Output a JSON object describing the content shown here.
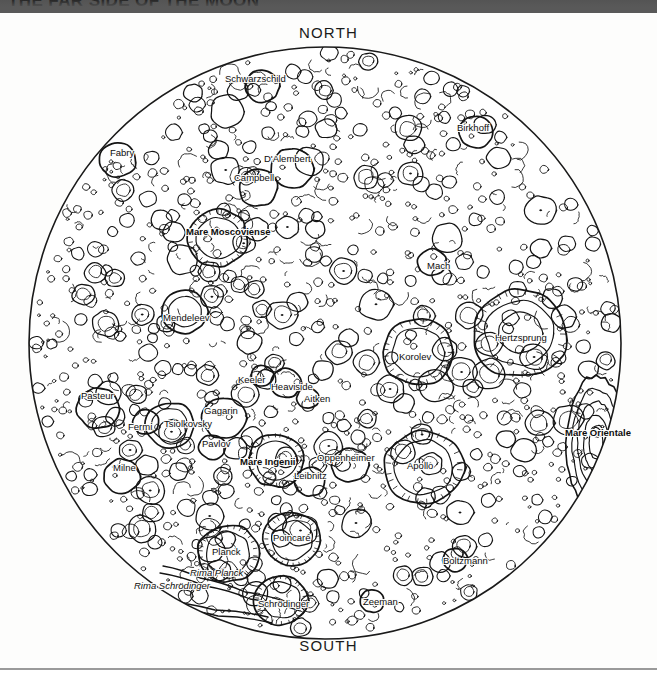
{
  "banner": {
    "title": "THE FAR SIDE OF THE MOON",
    "background_color": "#595959"
  },
  "map": {
    "cardinals": {
      "north": "NORTH",
      "south": "SOUTH"
    },
    "disc": {
      "center_x": 325,
      "center_y": 343,
      "radius": 297,
      "outline_color": "#1a1a1a",
      "fill_color": "#ffffff"
    },
    "features": [
      {
        "name": "Schwarzschild",
        "kind": "crater",
        "x": 255,
        "y": 79
      },
      {
        "name": "Birkhoff",
        "kind": "crater",
        "x": 473,
        "y": 128
      },
      {
        "name": "Fabry",
        "kind": "crater",
        "x": 122,
        "y": 153
      },
      {
        "name": "D'Alembert",
        "kind": "crater",
        "x": 287,
        "y": 159
      },
      {
        "name": "Campbell",
        "kind": "crater",
        "x": 254,
        "y": 178
      },
      {
        "name": "Mare Moscoviense",
        "kind": "mare",
        "x": 228,
        "y": 232
      },
      {
        "name": "Mach",
        "kind": "crater",
        "x": 438,
        "y": 266
      },
      {
        "name": "Mendeleev",
        "kind": "crater",
        "x": 186,
        "y": 318
      },
      {
        "name": "Hertzsprung",
        "kind": "mare_basin",
        "x": 521,
        "y": 338
      },
      {
        "name": "Korolev",
        "kind": "crater",
        "x": 415,
        "y": 357
      },
      {
        "name": "Keeler",
        "kind": "crater",
        "x": 251,
        "y": 380
      },
      {
        "name": "Heaviside",
        "kind": "crater",
        "x": 292,
        "y": 387
      },
      {
        "name": "Aitken",
        "kind": "crater",
        "x": 317,
        "y": 399
      },
      {
        "name": "Pasteur",
        "kind": "crater",
        "x": 97,
        "y": 396
      },
      {
        "name": "Gagarin",
        "kind": "crater",
        "x": 221,
        "y": 411
      },
      {
        "name": "Tsiolkovsky",
        "kind": "crater",
        "x": 188,
        "y": 424
      },
      {
        "name": "Fermi",
        "kind": "crater",
        "x": 140,
        "y": 427
      },
      {
        "name": "Pavlov",
        "kind": "crater",
        "x": 216,
        "y": 444
      },
      {
        "name": "Mare Orientale",
        "kind": "mare",
        "x": 598,
        "y": 433
      },
      {
        "name": "Oppenheimer",
        "kind": "crater",
        "x": 346,
        "y": 458
      },
      {
        "name": "Mare Ingenii",
        "kind": "mare",
        "x": 267,
        "y": 462
      },
      {
        "name": "Apollo",
        "kind": "crater",
        "x": 420,
        "y": 466
      },
      {
        "name": "Milne",
        "kind": "crater",
        "x": 124,
        "y": 468
      },
      {
        "name": "Leibnitz",
        "kind": "crater",
        "x": 310,
        "y": 476
      },
      {
        "name": "Poincaré",
        "kind": "crater",
        "x": 292,
        "y": 538
      },
      {
        "name": "Planck",
        "kind": "crater",
        "x": 226,
        "y": 552
      },
      {
        "name": "Boltzmann",
        "kind": "crater",
        "x": 465,
        "y": 561
      },
      {
        "name": "Rima Planck",
        "kind": "rima",
        "x": 216,
        "y": 573
      },
      {
        "name": "Rima Schrödinger",
        "kind": "rima",
        "x": 172,
        "y": 586
      },
      {
        "name": "Schrödinger",
        "kind": "crater",
        "x": 283,
        "y": 604
      },
      {
        "name": "Zeeman",
        "kind": "crater",
        "x": 380,
        "y": 602
      }
    ]
  }
}
